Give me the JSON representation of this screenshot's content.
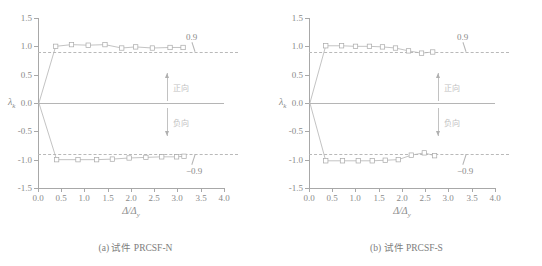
{
  "figure": {
    "panels": [
      {
        "id": "panel-a",
        "caption": "(a) 试件 PRCSF-N",
        "chart_data": {
          "type": "line",
          "title": "(a) 试件 PRCSF-N",
          "xlabel": "Δ/Δy",
          "ylabel": "λk",
          "xlim": [
            0.0,
            4.0
          ],
          "ylim": [
            -1.5,
            1.5
          ],
          "xticks": [
            "0.0",
            "0.5",
            "1.0",
            "1.5",
            "2.0",
            "2.5",
            "3.0",
            "3.5",
            "4.0"
          ],
          "yticks": [
            "1.5",
            "1.0",
            "0.5",
            "0.0",
            "-0.5",
            "-1.0",
            "-1.5"
          ],
          "grid": false,
          "legend": "none",
          "reference_lines": [
            {
              "value": 0.9,
              "label": "0.9",
              "style": "dashed"
            },
            {
              "value": -0.9,
              "label": "−0.9",
              "style": "dashed"
            },
            {
              "value": 0.0,
              "label": "",
              "style": "solid"
            }
          ],
          "annotations": [
            {
              "text": "正向",
              "direction": "up",
              "x": 3.1,
              "y": 0.35
            },
            {
              "text": "负向",
              "direction": "down",
              "x": 3.1,
              "y": -0.35
            }
          ],
          "series": [
            {
              "name": "positive",
              "marker": "square",
              "x": [
                0.02,
                0.38,
                0.72,
                1.08,
                1.44,
                1.8,
                2.1,
                2.46,
                2.84,
                3.12
              ],
              "y": [
                0.0,
                1.0,
                1.03,
                1.02,
                1.03,
                0.97,
                0.99,
                0.97,
                0.98,
                0.98
              ]
            },
            {
              "name": "negative",
              "marker": "square",
              "x": [
                0.02,
                0.4,
                0.86,
                1.26,
                1.6,
                1.96,
                2.32,
                2.66,
                2.98,
                3.14
              ],
              "y": [
                0.0,
                -1.0,
                -1.0,
                -1.0,
                -0.99,
                -0.97,
                -0.96,
                -0.95,
                -0.95,
                -0.94
              ]
            }
          ]
        }
      },
      {
        "id": "panel-b",
        "caption": "(b) 试件 PRCSF-S",
        "chart_data": {
          "type": "line",
          "title": "(b) 试件 PRCSF-S",
          "xlabel": "Δ/Δy",
          "ylabel": "λk",
          "xlim": [
            0.0,
            4.0
          ],
          "ylim": [
            -1.5,
            1.5
          ],
          "xticks": [
            "0.0",
            "0.5",
            "1.0",
            "1.5",
            "2.0",
            "2.5",
            "3.0",
            "3.5",
            "4.0"
          ],
          "yticks": [
            "1.5",
            "1.0",
            "0.5",
            "0.0",
            "-0.5",
            "-1.0",
            "-1.5"
          ],
          "grid": false,
          "legend": "none",
          "reference_lines": [
            {
              "value": 0.9,
              "label": "0.9",
              "style": "dashed"
            },
            {
              "value": -0.9,
              "label": "−0.9",
              "style": "dashed"
            },
            {
              "value": 0.0,
              "label": "",
              "style": "solid"
            }
          ],
          "annotations": [
            {
              "text": "正向",
              "direction": "up",
              "x": 3.1,
              "y": 0.35
            },
            {
              "text": "负向",
              "direction": "down",
              "x": 3.1,
              "y": -0.35
            }
          ],
          "series": [
            {
              "name": "positive",
              "marker": "square",
              "x": [
                0.02,
                0.36,
                0.7,
                1.0,
                1.3,
                1.58,
                1.86,
                2.14,
                2.42,
                2.66
              ],
              "y": [
                0.0,
                1.01,
                1.01,
                1.0,
                1.0,
                0.99,
                0.97,
                0.92,
                0.88,
                0.9
              ]
            },
            {
              "name": "negative",
              "marker": "square",
              "x": [
                0.02,
                0.36,
                0.72,
                1.06,
                1.36,
                1.64,
                1.92,
                2.2,
                2.48,
                2.7
              ],
              "y": [
                0.0,
                -1.02,
                -1.02,
                -1.02,
                -1.02,
                -1.01,
                -1.0,
                -0.92,
                -0.88,
                -0.93
              ]
            }
          ]
        }
      }
    ]
  }
}
